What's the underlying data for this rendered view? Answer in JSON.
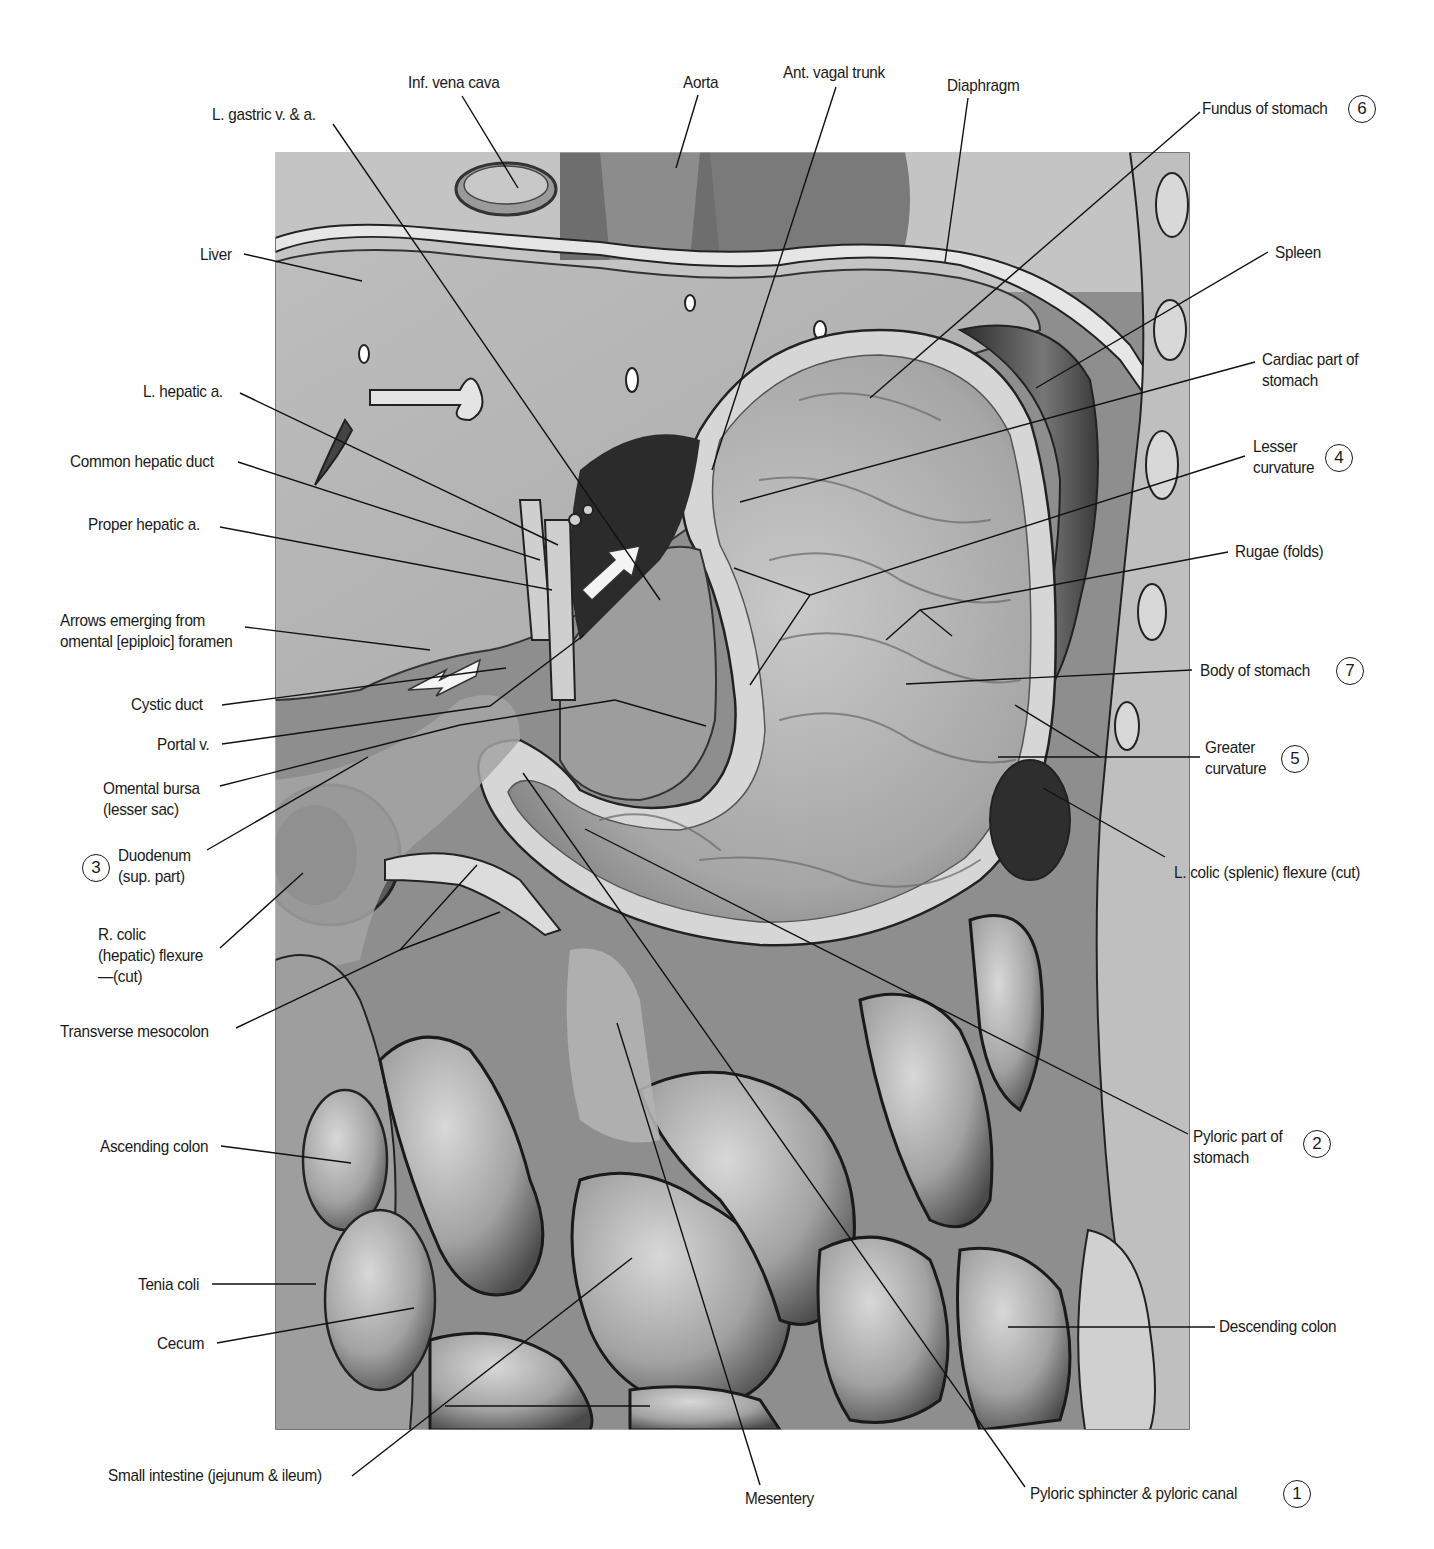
{
  "figure": {
    "image_box": {
      "x": 275,
      "y": 152,
      "w": 915,
      "h": 1278
    },
    "colors": {
      "background": "#ffffff",
      "liver": "#b9b9b9",
      "stomach_wall": "#cfcfcf",
      "lumen": "#a8a8a8",
      "dark": "#303030",
      "text": "#1a1a1a",
      "leader": "#111111"
    }
  },
  "labels": [
    {
      "id": "l-gastric",
      "text": "L. gastric v. & a.",
      "x": 212,
      "y": 104,
      "align": "l",
      "line": [
        [
          333,
          124
        ],
        [
          660,
          600
        ]
      ]
    },
    {
      "id": "ivc",
      "text": "Inf. vena cava",
      "x": 408,
      "y": 72,
      "align": "l",
      "line": [
        [
          462,
          96
        ],
        [
          518,
          188
        ]
      ]
    },
    {
      "id": "aorta",
      "text": "Aorta",
      "x": 683,
      "y": 72,
      "align": "l",
      "line": [
        [
          698,
          95
        ],
        [
          676,
          168
        ]
      ]
    },
    {
      "id": "ant-vagal",
      "text": "Ant. vagal trunk",
      "x": 783,
      "y": 62,
      "align": "l",
      "line": [
        [
          836,
          87
        ],
        [
          712,
          470
        ]
      ]
    },
    {
      "id": "diaphragm",
      "text": "Diaphragm",
      "x": 947,
      "y": 75,
      "align": "l",
      "line": [
        [
          968,
          98
        ],
        [
          945,
          262
        ]
      ]
    },
    {
      "id": "fundus",
      "text": "Fundus of stomach",
      "x": 1202,
      "y": 98,
      "align": "l",
      "num": "6",
      "num_x": 1348,
      "num_y": 95,
      "line": [
        [
          1200,
          112
        ],
        [
          870,
          398
        ]
      ]
    },
    {
      "id": "liver",
      "text": "Liver",
      "x": 200,
      "y": 244,
      "align": "l",
      "line": [
        [
          244,
          254
        ],
        [
          362,
          281
        ]
      ]
    },
    {
      "id": "spleen",
      "text": "Spleen",
      "x": 1275,
      "y": 242,
      "align": "l",
      "line": [
        [
          1268,
          252
        ],
        [
          1036,
          388
        ]
      ]
    },
    {
      "id": "cardiac",
      "text": "Cardiac part of\nstomach",
      "x": 1262,
      "y": 349,
      "align": "l",
      "line": [
        [
          1255,
          362
        ],
        [
          740,
          502
        ]
      ]
    },
    {
      "id": "l-hepatic",
      "text": "L. hepatic a.",
      "x": 143,
      "y": 381,
      "align": "l",
      "line": [
        [
          240,
          393
        ],
        [
          558,
          545
        ]
      ]
    },
    {
      "id": "lesser",
      "text": "Lesser\ncurvature",
      "x": 1253,
      "y": 436,
      "align": "l",
      "num": "4",
      "num_x": 1325,
      "num_y": 444,
      "line": [
        [
          1245,
          456
        ],
        [
          810,
          595
        ],
        [
          750,
          685
        ]
      ],
      "line2": [
        [
          810,
          595
        ],
        [
          734,
          568
        ]
      ]
    },
    {
      "id": "common-hepatic",
      "text": "Common hepatic duct",
      "x": 70,
      "y": 451,
      "align": "l",
      "line": [
        [
          238,
          462
        ],
        [
          540,
          560
        ]
      ]
    },
    {
      "id": "proper-hepatic",
      "text": "Proper hepatic a.",
      "x": 88,
      "y": 514,
      "align": "l",
      "line": [
        [
          220,
          527
        ],
        [
          552,
          590
        ]
      ]
    },
    {
      "id": "rugae",
      "text": "Rugae (folds)",
      "x": 1235,
      "y": 541,
      "align": "l",
      "line": [
        [
          1228,
          552
        ],
        [
          920,
          610
        ],
        [
          886,
          640
        ]
      ],
      "line2": [
        [
          920,
          610
        ],
        [
          952,
          636
        ]
      ]
    },
    {
      "id": "arrows",
      "text": "Arrows emerging from\nomental [epiploic] foramen",
      "x": 60,
      "y": 610,
      "align": "l",
      "line": [
        [
          245,
          627
        ],
        [
          430,
          650
        ]
      ]
    },
    {
      "id": "body",
      "text": "Body of stomach",
      "x": 1200,
      "y": 660,
      "align": "l",
      "num": "7",
      "num_x": 1336,
      "num_y": 657,
      "line": [
        [
          1192,
          670
        ],
        [
          906,
          684
        ]
      ]
    },
    {
      "id": "cystic",
      "text": "Cystic duct",
      "x": 131,
      "y": 694,
      "align": "l",
      "line": [
        [
          222,
          705
        ],
        [
          506,
          668
        ]
      ]
    },
    {
      "id": "portal",
      "text": "Portal v.",
      "x": 157,
      "y": 734,
      "align": "l",
      "line": [
        [
          222,
          744
        ],
        [
          490,
          706
        ],
        [
          584,
          635
        ]
      ]
    },
    {
      "id": "greater",
      "text": "Greater\ncurvature",
      "x": 1205,
      "y": 737,
      "align": "l",
      "num": "5",
      "num_x": 1281,
      "num_y": 745,
      "line": [
        [
          1200,
          757
        ],
        [
          1100,
          757
        ],
        [
          1015,
          705
        ]
      ],
      "line2": [
        [
          1100,
          757
        ],
        [
          998,
          757
        ]
      ]
    },
    {
      "id": "omental-bursa",
      "text": "Omental bursa\n(lesser sac)",
      "x": 103,
      "y": 778,
      "align": "l",
      "line": [
        [
          220,
          786
        ],
        [
          460,
          725
        ],
        [
          615,
          700
        ]
      ],
      "line2": [
        [
          615,
          700
        ],
        [
          706,
          726
        ]
      ]
    },
    {
      "id": "duodenum",
      "text": "Duodenum\n(sup. part)",
      "x": 118,
      "y": 845,
      "align": "l",
      "num": "3",
      "num_x": 82,
      "num_y": 854,
      "line": [
        [
          207,
          850
        ],
        [
          368,
          757
        ]
      ]
    },
    {
      "id": "l-colic",
      "text": "L. colic (splenic) flexure (cut)",
      "x": 1174,
      "y": 862,
      "align": "l",
      "line": [
        [
          1165,
          857
        ],
        [
          1043,
          788
        ]
      ]
    },
    {
      "id": "r-colic",
      "text": "R. colic\n(hepatic) flexure\n—(cut)",
      "x": 98,
      "y": 924,
      "align": "l",
      "line": [
        [
          220,
          948
        ],
        [
          303,
          873
        ]
      ]
    },
    {
      "id": "transverse-meso",
      "text": "Transverse mesocolon",
      "x": 60,
      "y": 1021,
      "align": "l",
      "line": [
        [
          236,
          1028
        ],
        [
          400,
          950
        ],
        [
          477,
          865
        ]
      ],
      "line2": [
        [
          400,
          950
        ],
        [
          500,
          912
        ]
      ]
    },
    {
      "id": "ascending",
      "text": "Ascending colon",
      "x": 100,
      "y": 1136,
      "align": "l",
      "line": [
        [
          221,
          1146
        ],
        [
          351,
          1163
        ]
      ]
    },
    {
      "id": "pyloric-part",
      "text": "Pyloric part of\nstomach",
      "x": 1193,
      "y": 1126,
      "align": "l",
      "num": "2",
      "num_x": 1303,
      "num_y": 1130,
      "line": [
        [
          1188,
          1134
        ],
        [
          585,
          829
        ]
      ]
    },
    {
      "id": "tenia",
      "text": "Tenia coli",
      "x": 138,
      "y": 1274,
      "align": "l",
      "line": [
        [
          212,
          1284
        ],
        [
          316,
          1284
        ]
      ]
    },
    {
      "id": "descending",
      "text": "Descending colon",
      "x": 1219,
      "y": 1316,
      "align": "l",
      "line": [
        [
          1215,
          1327
        ],
        [
          1008,
          1327
        ]
      ]
    },
    {
      "id": "cecum",
      "text": "Cecum",
      "x": 157,
      "y": 1333,
      "align": "l",
      "line": [
        [
          217,
          1343
        ],
        [
          414,
          1308
        ]
      ]
    },
    {
      "id": "small-int",
      "text": "Small intestine (jejunum & ileum)",
      "x": 108,
      "y": 1465,
      "align": "l",
      "line": [
        [
          352,
          1476
        ],
        [
          632,
          1258
        ]
      ],
      "line2": [
        [
          445,
          1406
        ],
        [
          650,
          1406
        ]
      ]
    },
    {
      "id": "mesentery",
      "text": "Mesentery",
      "x": 745,
      "y": 1488,
      "align": "l",
      "line": [
        [
          760,
          1485
        ],
        [
          617,
          1023
        ]
      ]
    },
    {
      "id": "pyloric-sphincter",
      "text": "Pyloric sphincter & pyloric canal",
      "x": 1030,
      "y": 1483,
      "align": "l",
      "num": "1",
      "num_x": 1283,
      "num_y": 1480,
      "line": [
        [
          1025,
          1487
        ],
        [
          523,
          773
        ]
      ]
    }
  ]
}
